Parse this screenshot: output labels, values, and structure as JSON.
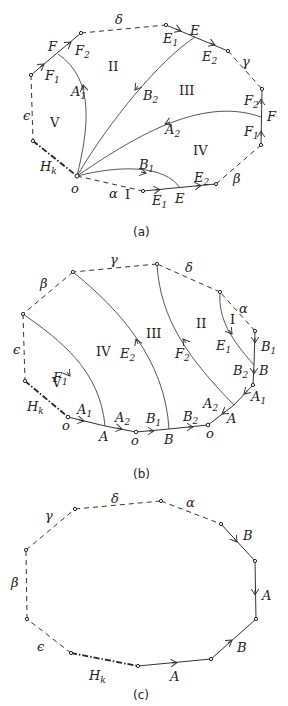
{
  "figures": [
    {
      "id": "a",
      "caption": "(a)",
      "regions": [
        "I",
        "II",
        "III",
        "IV",
        "V"
      ],
      "boundary_labels": {
        "alpha": "α",
        "beta": "β",
        "gamma": "γ",
        "delta": "δ",
        "epsilon": "ϵ",
        "hk_main": "H",
        "hk_sub": "k"
      },
      "vertex_labels": {
        "o": "o"
      },
      "edge_labels": [
        {
          "main": "F",
          "sub": ""
        },
        {
          "main": "F",
          "sub": "1"
        },
        {
          "main": "F",
          "sub": "2"
        },
        {
          "main": "E",
          "sub": "1"
        },
        {
          "main": "E",
          "sub": ""
        },
        {
          "main": "E",
          "sub": "2"
        },
        {
          "main": "F",
          "sub": "2"
        },
        {
          "main": "F",
          "sub": ""
        },
        {
          "main": "F",
          "sub": "1"
        },
        {
          "main": "E",
          "sub": "2"
        },
        {
          "main": "E",
          "sub": ""
        },
        {
          "main": "E",
          "sub": "1"
        },
        {
          "main": "A",
          "sub": "1"
        },
        {
          "main": "B",
          "sub": "2"
        },
        {
          "main": "A",
          "sub": "2"
        },
        {
          "main": "B",
          "sub": "1"
        }
      ]
    },
    {
      "id": "b",
      "caption": "(b)",
      "regions": [
        "I",
        "II",
        "III",
        "IV",
        "V"
      ],
      "boundary_labels": {
        "alpha": "α",
        "beta": "β",
        "gamma": "γ",
        "delta": "δ",
        "epsilon": "ϵ",
        "hk_main": "H",
        "hk_sub": "k"
      },
      "vertex_labels": {
        "o": "o"
      },
      "edge_labels": [
        {
          "main": "A",
          "sub": "1"
        },
        {
          "main": "A",
          "sub": ""
        },
        {
          "main": "A",
          "sub": "2"
        },
        {
          "main": "B",
          "sub": "1"
        },
        {
          "main": "B",
          "sub": ""
        },
        {
          "main": "B",
          "sub": "2"
        },
        {
          "main": "A",
          "sub": "2"
        },
        {
          "main": "A",
          "sub": ""
        },
        {
          "main": "A",
          "sub": "1"
        },
        {
          "main": "B",
          "sub": "2"
        },
        {
          "main": "B",
          "sub": ""
        },
        {
          "main": "B",
          "sub": "1"
        },
        {
          "main": "E",
          "sub": "1"
        },
        {
          "main": "F",
          "sub": "2"
        },
        {
          "main": "E",
          "sub": "2"
        },
        {
          "main": "F",
          "sub": "1"
        }
      ]
    },
    {
      "id": "c",
      "caption": "(c)",
      "boundary_labels": {
        "alpha": "α",
        "beta": "β",
        "gamma": "γ",
        "delta": "δ",
        "epsilon": "ϵ",
        "hk_main": "H",
        "hk_sub": "k"
      },
      "edge_labels": [
        "B",
        "A",
        "B",
        "A"
      ]
    }
  ]
}
